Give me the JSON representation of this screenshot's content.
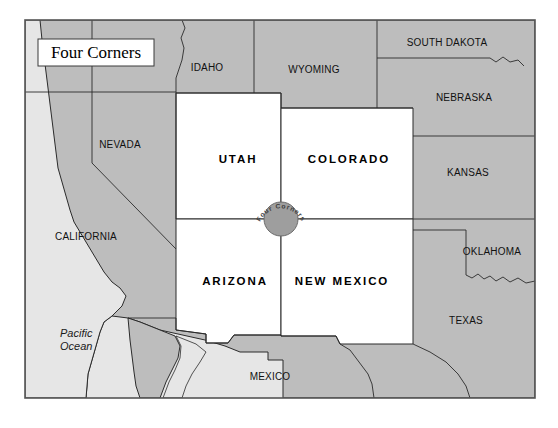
{
  "map": {
    "title": "Four Corners",
    "title_box": {
      "x": 38,
      "y": 39,
      "width": 116,
      "height": 27
    },
    "frame": {
      "x": 25,
      "y": 20,
      "width": 510,
      "height": 378
    },
    "colors": {
      "land_fill": "#bdbdbd",
      "highlight_fill": "#ffffff",
      "ocean_fill": "#e6e6e6",
      "border_stroke": "#2b2b2b",
      "frame_stroke": "#555555",
      "marker_fill": "#9e9e9e",
      "marker_stroke": "#6b6b6b",
      "page_background": "#ffffff",
      "label_color": "#111111",
      "title_box_fill": "#ffffff"
    },
    "marker": {
      "name": "four-corners-point",
      "label": "Four Corners",
      "cx": 281,
      "cy": 219,
      "r": 17
    },
    "highlighted_states": [
      {
        "name": "UTAH",
        "label": "UTAH",
        "label_x": 238,
        "label_y": 163
      },
      {
        "name": "COLORADO",
        "label": "COLORADO",
        "label_x": 349,
        "label_y": 163
      },
      {
        "name": "ARIZONA",
        "label": "ARIZONA",
        "label_x": 235,
        "label_y": 285
      },
      {
        "name": "NEW MEXICO",
        "label": "NEW MEXICO",
        "label_x": 342,
        "label_y": 285
      }
    ],
    "context_states": [
      {
        "name": "IDAHO",
        "label": "IDAHO",
        "label_x": 207,
        "label_y": 71
      },
      {
        "name": "WYOMING",
        "label": "WYOMING",
        "label_x": 314,
        "label_y": 73
      },
      {
        "name": "SOUTH DAKOTA",
        "label": "SOUTH DAKOTA",
        "label_x": 447,
        "label_y": 46
      },
      {
        "name": "NEBRASKA",
        "label": "NEBRASKA",
        "label_x": 464,
        "label_y": 101
      },
      {
        "name": "NEVADA",
        "label": "NEVADA",
        "label_x": 120,
        "label_y": 148
      },
      {
        "name": "KANSAS",
        "label": "KANSAS",
        "label_x": 468,
        "label_y": 176
      },
      {
        "name": "CALIFORNIA",
        "label": "CALIFORNIA",
        "label_x": 86,
        "label_y": 240
      },
      {
        "name": "OKLAHOMA",
        "label": "OKLAHOMA",
        "label_x": 492,
        "label_y": 255
      },
      {
        "name": "TEXAS",
        "label": "TEXAS",
        "label_x": 466,
        "label_y": 324
      },
      {
        "name": "MEXICO",
        "label": "MEXICO",
        "label_x": 270,
        "label_y": 380
      }
    ],
    "water_labels": [
      {
        "name": "pacific-ocean",
        "line1": "Pacific",
        "line2": "Ocean",
        "x": 60,
        "y": 337
      }
    ]
  }
}
